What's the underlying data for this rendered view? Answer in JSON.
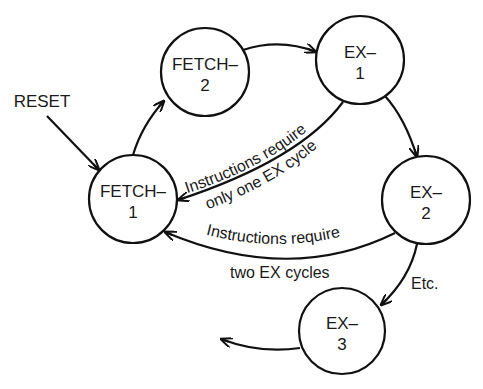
{
  "diagram": {
    "type": "state-machine",
    "nodes": [
      {
        "id": "fetch1",
        "line1": "FETCH–",
        "line2": "1"
      },
      {
        "id": "fetch2",
        "line1": "FETCH–",
        "line2": "2"
      },
      {
        "id": "ex1",
        "line1": "EX–",
        "line2": "1"
      },
      {
        "id": "ex2",
        "line1": "EX–",
        "line2": "2"
      },
      {
        "id": "ex3",
        "line1": "EX–",
        "line2": "3"
      }
    ],
    "reset_label": "RESET",
    "edges": [
      {
        "from": "reset",
        "to": "fetch1",
        "label": ""
      },
      {
        "from": "fetch1",
        "to": "fetch2",
        "label": ""
      },
      {
        "from": "fetch2",
        "to": "ex1",
        "label": ""
      },
      {
        "from": "ex1",
        "to": "ex2",
        "label": ""
      },
      {
        "from": "ex1",
        "to": "fetch1",
        "label_line1": "Instructions require",
        "label_line2": "only one EX cycle"
      },
      {
        "from": "ex2",
        "to": "fetch1",
        "label_line1": "Instructions require",
        "label_line2": "two EX cycles"
      },
      {
        "from": "ex2",
        "to": "ex3",
        "label": "Etc."
      },
      {
        "from": "ex3",
        "to": "continuation",
        "label": ""
      }
    ]
  }
}
